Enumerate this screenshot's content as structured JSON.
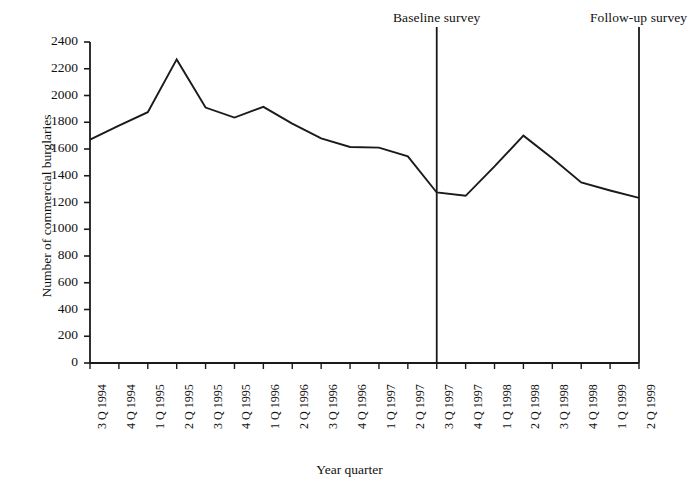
{
  "chart_data": {
    "type": "line",
    "title": "",
    "xlabel": "Year quarter",
    "ylabel": "Number of commercial burglaries",
    "ylim": [
      0,
      2400
    ],
    "ytick_step": 200,
    "yticks": [
      "2400",
      "2200",
      "2000",
      "1800",
      "1600",
      "1400",
      "1200",
      "1000",
      "800",
      "600",
      "400",
      "200",
      "0"
    ],
    "grid": false,
    "legend": "none",
    "categories": [
      "3 Q 1994",
      "4 Q 1994",
      "1 Q 1995",
      "2 Q 1995",
      "3 Q 1995",
      "4 Q 1995",
      "1 Q 1996",
      "2 Q 1996",
      "3 Q 1996",
      "4 Q 1996",
      "1 Q 1997",
      "2 Q 1997",
      "3 Q 1997",
      "4 Q 1997",
      "1 Q 1998",
      "2 Q 1998",
      "3 Q 1998",
      "4 Q 1998",
      "1 Q 1999",
      "2 Q 1999"
    ],
    "values": [
      1670,
      1775,
      1875,
      2270,
      1910,
      1835,
      1915,
      1790,
      1680,
      1615,
      1610,
      1545,
      1275,
      1250,
      1470,
      1700,
      1530,
      1350,
      1290,
      1235
    ],
    "annotations": [
      {
        "label": "Baseline survey",
        "category": "3 Q 1997",
        "type": "vertical-line"
      },
      {
        "label": "Follow-up survey",
        "category": "2 Q 1999",
        "type": "vertical-line"
      }
    ],
    "series_color": "#1a1a1a",
    "axis_color": "#1a1a1a"
  }
}
